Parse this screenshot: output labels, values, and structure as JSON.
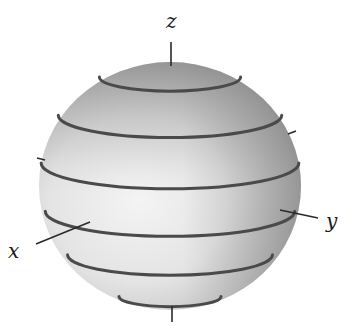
{
  "figure": {
    "type": "sphere-with-latitude-circles",
    "colors": {
      "sphere_light": "#f2f2f2",
      "sphere_mid": "#c8c8c8",
      "sphere_dark": "#8a8a8a",
      "ring": "#4a4a4a",
      "axis": "#2a2a2a",
      "label": "#1a1a1a"
    },
    "axes": [
      {
        "name": "x",
        "label": "x"
      },
      {
        "name": "y",
        "label": "y"
      },
      {
        "name": "z",
        "label": "z"
      }
    ],
    "latitude_rings": 6
  }
}
